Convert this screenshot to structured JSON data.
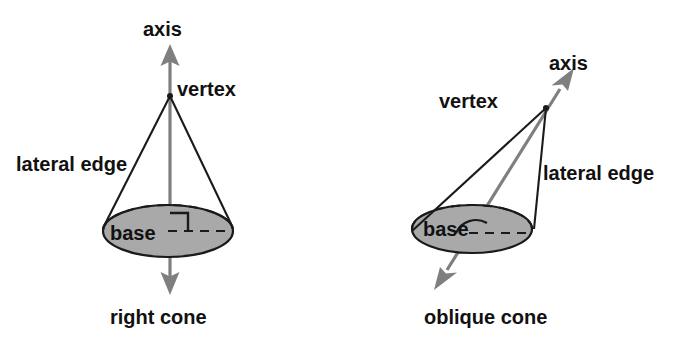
{
  "figure": {
    "background_color": "#ffffff",
    "width": 676,
    "height": 339
  },
  "colors": {
    "outline": "#1a1a1a",
    "base_fill": "#a9a9a9",
    "axis_gray": "#7f7f7f",
    "label_text": "#111111",
    "dashed_stroke": "#1a1a1a"
  },
  "diagrams": [
    {
      "id": "right-cone",
      "caption": "right cone",
      "labels": {
        "axis": "axis",
        "vertex": "vertex",
        "lateral_edge": "lateral edge",
        "base": "base",
        "caption": "right cone"
      },
      "angle_marker": "right-angle-square",
      "geometry": {
        "apex": [
          170,
          96
        ],
        "base_center": [
          168,
          231
        ],
        "base_rx": 65,
        "base_ry": 26,
        "axis_arrow_top": [
          170,
          46
        ],
        "axis_arrow_bottom": [
          170,
          293
        ],
        "left_edge_end": [
          103,
          228
        ],
        "right_edge_end": [
          233,
          228
        ]
      }
    },
    {
      "id": "oblique-cone",
      "caption": "oblique cone",
      "labels": {
        "axis": "axis",
        "vertex": "vertex",
        "lateral_edge": "lateral edge",
        "base": "base",
        "caption": "oblique cone"
      },
      "angle_marker": "acute-angle-arc",
      "geometry": {
        "apex": [
          546,
          108
        ],
        "base_center": [
          472,
          229
        ],
        "base_rx": 60,
        "base_ry": 24,
        "axis_arrow_top": [
          573,
          70
        ],
        "axis_arrow_bottom": [
          437,
          288
        ],
        "left_edge_end": [
          412,
          231
        ],
        "right_edge_end": [
          534,
          229
        ]
      }
    }
  ]
}
